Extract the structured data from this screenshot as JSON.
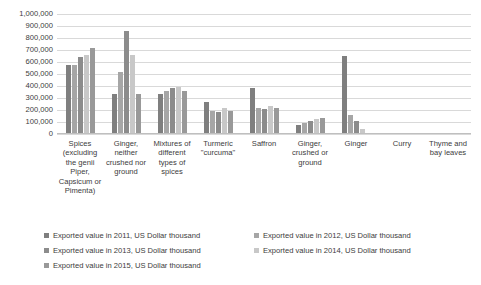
{
  "chart_data": {
    "type": "bar",
    "title": "",
    "xlabel": "",
    "ylabel": "",
    "ylim": [
      0,
      1000000
    ],
    "grid": true,
    "legend_position": "bottom",
    "ytick_labels": [
      "1,000,000",
      "900,000",
      "800,000",
      "700,000",
      "600,000",
      "500,000",
      "400,000",
      "300,000",
      "200,000",
      "100,000",
      "0"
    ],
    "ytick_values": [
      1000000,
      900000,
      800000,
      700000,
      600000,
      500000,
      400000,
      300000,
      200000,
      100000,
      0
    ],
    "categories": [
      "Spices (excluding the genii Piper, Capsicum or Pimenta)",
      "Ginger, neither crushed nor ground",
      "Mixtures of different types of spices",
      "Turmeric \"curcuma\"",
      "Saffron",
      "Ginger, crushed or ground",
      "Ginger",
      "Curry",
      "Thyme and bay leaves"
    ],
    "series": [
      {
        "name": "Exported value in 2011, US Dollar thousand",
        "color": "#7f7f7f",
        "values": [
          575000,
          330000,
          330000,
          270000,
          385000,
          75000,
          650000,
          0,
          0
        ]
      },
      {
        "name": "Exported value in 2012, US Dollar thousand",
        "color": "#a6a6a6",
        "values": [
          575000,
          520000,
          355000,
          190000,
          220000,
          90000,
          155000,
          0,
          0
        ]
      },
      {
        "name": "Exported value in 2013, US Dollar thousand",
        "color": "#8c8c8c",
        "values": [
          640000,
          860000,
          380000,
          185000,
          210000,
          110000,
          105000,
          0,
          0
        ]
      },
      {
        "name": "Exported value in 2014, US Dollar thousand",
        "color": "#c8c8c8",
        "values": [
          655000,
          660000,
          390000,
          215000,
          230000,
          125000,
          40000,
          0,
          0
        ]
      },
      {
        "name": "Exported value in 2015, US Dollar thousand",
        "color": "#999999",
        "values": [
          715000,
          330000,
          360000,
          195000,
          215000,
          130000,
          8000,
          0,
          0
        ]
      }
    ]
  }
}
